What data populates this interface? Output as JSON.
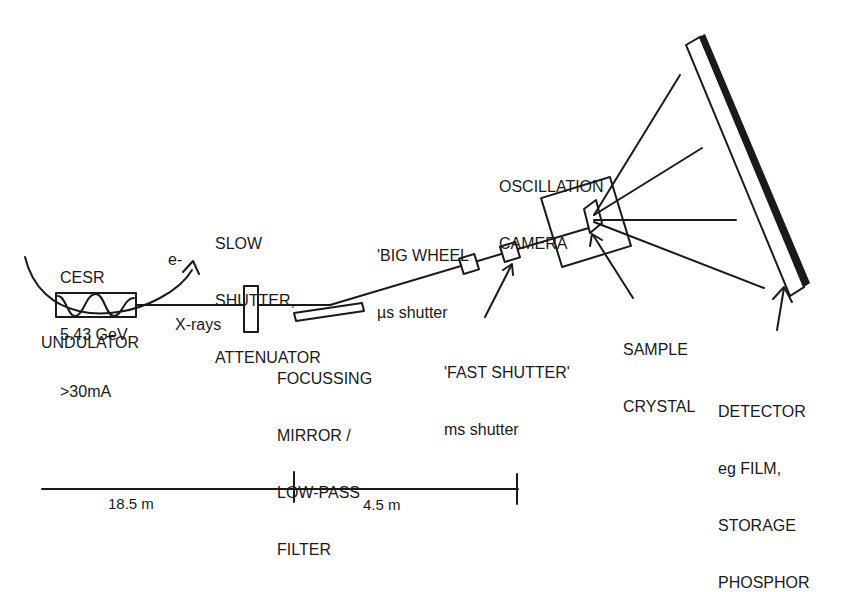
{
  "diagram": {
    "colors": {
      "ink": "#1a1a1a",
      "background": "#ffffff"
    },
    "source": {
      "ring_label": [
        "CESR",
        "5.43 GeV",
        ">30mA"
      ],
      "electron_label": "e-",
      "undulator_label": "UNDULATOR",
      "beam_label": "X-rays"
    },
    "slow_shutter": {
      "label": [
        "SLOW",
        "SHUTTER,",
        "ATTENUATOR"
      ]
    },
    "mirror": {
      "label": [
        "FOCUSSING",
        "MIRROR /",
        "LOW-PASS",
        "FILTER"
      ]
    },
    "big_wheel": {
      "label": [
        "'BIG WHEEL",
        "µs shutter"
      ]
    },
    "fast_shutter": {
      "label": [
        "'FAST SHUTTER'",
        "ms shutter"
      ]
    },
    "camera": {
      "label": [
        "OSCILLATION",
        "CAMERA"
      ]
    },
    "sample": {
      "label": [
        "SAMPLE",
        "CRYSTAL"
      ]
    },
    "detector": {
      "label": [
        "DETECTOR",
        "eg FILM,",
        "STORAGE",
        "PHOSPHOR"
      ]
    },
    "scale_bar": {
      "segments": [
        {
          "label": "18.5 m"
        },
        {
          "label": "4.5 m"
        }
      ]
    }
  }
}
